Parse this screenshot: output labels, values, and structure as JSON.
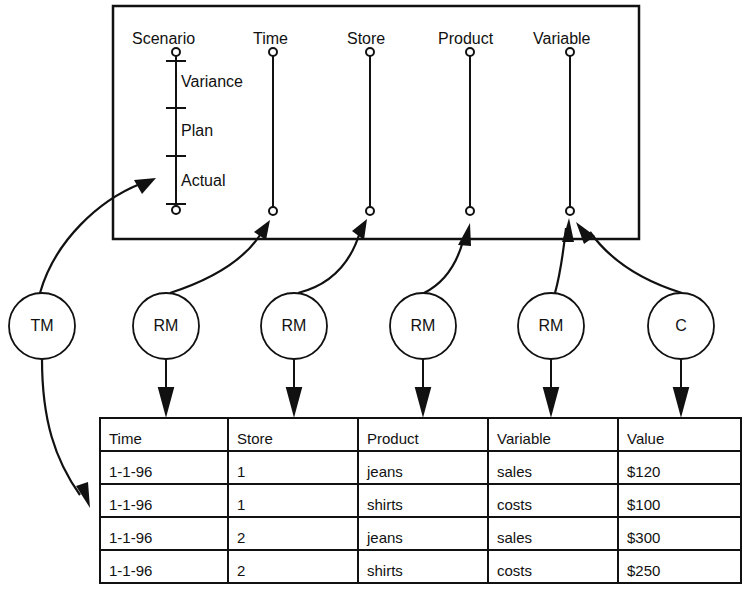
{
  "cube": {
    "dimensions": [
      {
        "name": "Scenario",
        "members": [
          "Variance",
          "Plan",
          "Actual"
        ]
      },
      {
        "name": "Time"
      },
      {
        "name": "Store"
      },
      {
        "name": "Product"
      },
      {
        "name": "Variable"
      }
    ]
  },
  "nodes": [
    {
      "label": "TM",
      "targets": "Scenario dimension / table (Time column side)"
    },
    {
      "label": "RM",
      "targets": "Time"
    },
    {
      "label": "RM",
      "targets": "Store"
    },
    {
      "label": "RM",
      "targets": "Product"
    },
    {
      "label": "RM",
      "targets": "Variable"
    },
    {
      "label": "C",
      "targets": "Variable"
    }
  ],
  "table": {
    "headers": [
      "Time",
      "Store",
      "Product",
      "Variable",
      "Value"
    ],
    "rows": [
      [
        "1-1-96",
        "1",
        "jeans",
        "sales",
        "$120"
      ],
      [
        "1-1-96",
        "1",
        "shirts",
        "costs",
        "$100"
      ],
      [
        "1-1-96",
        "2",
        "jeans",
        "sales",
        "$300"
      ],
      [
        "1-1-96",
        "2",
        "shirts",
        "costs",
        "$250"
      ]
    ]
  }
}
